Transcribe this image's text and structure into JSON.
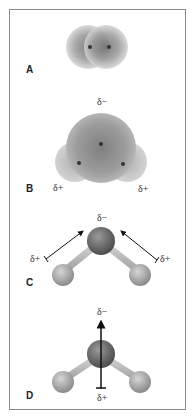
{
  "figure": {
    "panels": [
      {
        "label": "A",
        "charges": []
      },
      {
        "label": "B",
        "charges": {
          "top": "δ−",
          "left": "δ+",
          "right": "δ+"
        }
      },
      {
        "label": "C",
        "charges": {
          "top": "δ−",
          "left": "δ+",
          "right": "δ+"
        }
      },
      {
        "label": "D",
        "charges": {
          "top": "δ−",
          "bottom": "δ+"
        }
      }
    ]
  },
  "colors": {
    "border": "#8a8a8a",
    "cloud_dark": "#6e6e6e",
    "cloud_light": "#cfcfcf",
    "oxygen": "#6a6a6a",
    "hydrogen": "#a9a9a9",
    "bond": "#bdbdbd",
    "arrow": "#111111"
  }
}
